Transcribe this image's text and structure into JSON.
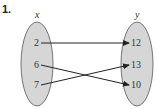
{
  "problem_number": "1.",
  "domain_set": {
    "label": "x",
    "elements": [
      "2",
      "6",
      "7"
    ]
  },
  "range_set": {
    "label": "y",
    "elements": [
      "12",
      "13",
      "10"
    ]
  },
  "mappings": [
    {
      "from": "2",
      "to": "12"
    },
    {
      "from": "6",
      "to": "10"
    },
    {
      "from": "7",
      "to": "13"
    }
  ],
  "colors": {
    "ellipse_fill": "#d6d6d6",
    "ellipse_stroke": "#555555",
    "arrow": "#222222"
  }
}
